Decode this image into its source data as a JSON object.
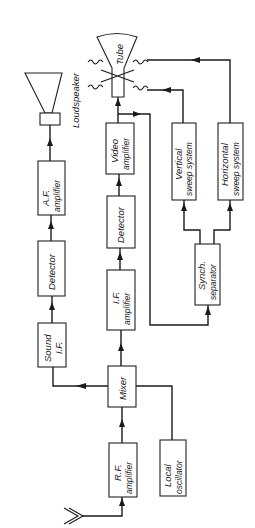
{
  "diagram": {
    "type": "block-diagram",
    "orientation": "rotated 90° counter-clockwise (text reads bottom-to-top)",
    "blocks": {
      "loudspeaker": {
        "label": "Loudspeaker"
      },
      "af_amplifier": {
        "line1": "A.F.",
        "line2": "amplifier"
      },
      "audio_detector": {
        "label": "Detector"
      },
      "sound_if": {
        "line1": "Sound",
        "line2": "I.F."
      },
      "mixer": {
        "label": "Mixer"
      },
      "rf_amplifier": {
        "line1": "R.F.",
        "line2": "amplifier"
      },
      "local_oscillator": {
        "line1": "Local",
        "line2": "oscillator"
      },
      "if_amplifier": {
        "line1": "I.F.",
        "line2": "amplifier"
      },
      "video_detector": {
        "label": "Detector"
      },
      "video_amplifier": {
        "line1": "Video",
        "line2": "amplifier"
      },
      "tube": {
        "label": "Tube"
      },
      "vertical_sweep": {
        "line1": "Vertical",
        "line2": "sweep system"
      },
      "horizontal_sweep": {
        "line1": "Horizontal",
        "line2": "sweep system"
      },
      "synch_separator": {
        "line1": "Synch.",
        "line2": "separator"
      }
    },
    "connections": [
      {
        "from": "Antenna",
        "to": "R.F. amplifier"
      },
      {
        "from": "R.F. amplifier",
        "to": "Mixer"
      },
      {
        "from": "Local oscillator",
        "to": "Mixer"
      },
      {
        "from": "Mixer",
        "to": "Sound I.F."
      },
      {
        "from": "Mixer",
        "to": "I.F. amplifier"
      },
      {
        "from": "Sound I.F.",
        "to": "Detector (audio)"
      },
      {
        "from": "Detector (audio)",
        "to": "A.F. amplifier"
      },
      {
        "from": "A.F. amplifier",
        "to": "Loudspeaker"
      },
      {
        "from": "I.F. amplifier",
        "to": "Detector (video)"
      },
      {
        "from": "Detector (video)",
        "to": "Video amplifier"
      },
      {
        "from": "Video amplifier",
        "to": "Tube"
      },
      {
        "from": "Video amplifier",
        "to": "Synch. separator"
      },
      {
        "from": "Synch. separator",
        "to": "Vertical sweep system"
      },
      {
        "from": "Synch. separator",
        "to": "Horizontal sweep system"
      },
      {
        "from": "Vertical sweep system",
        "to": "Tube deflection coils"
      },
      {
        "from": "Horizontal sweep system",
        "to": "Tube deflection coils"
      }
    ]
  }
}
